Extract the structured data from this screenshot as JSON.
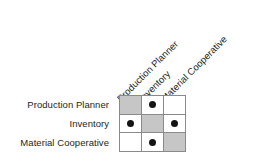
{
  "figure": {
    "kind": "design-structure-matrix",
    "background_color": "#ffffff",
    "grid_line_color": "#8a8a8a",
    "diagonal_cell_color": "#c6c6c6",
    "empty_cell_color": "#ffffff",
    "mark_color": "#141414",
    "mark_glyph": "filled-circle",
    "text_color": "#231f20",
    "column_label_rotation_degrees": -45
  },
  "chart_data": {
    "type": "heatmap",
    "title": "",
    "xlabel": "",
    "ylabel": "",
    "row_labels": [
      "Production Planner",
      "Inventory",
      "Material Cooperative"
    ],
    "column_labels": [
      "Production Planner",
      "Inventory",
      "Material Cooperative"
    ],
    "cell_states": [
      [
        "diagonal",
        "marked",
        "empty"
      ],
      [
        "marked",
        "diagonal",
        "marked"
      ],
      [
        "empty",
        "marked",
        "diagonal"
      ]
    ],
    "values": [
      [
        null,
        1,
        0
      ],
      [
        1,
        null,
        1
      ],
      [
        0,
        1,
        null
      ]
    ],
    "legend": [],
    "grid": true
  }
}
